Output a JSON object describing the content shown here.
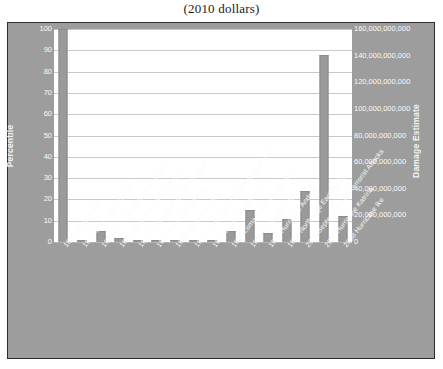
{
  "chart_data": {
    "type": "bar",
    "title": "(2010 dollars)",
    "xlabel": "",
    "ylabel": "Percentile",
    "y2label": "Damage Estimate",
    "ylim": [
      0,
      100
    ],
    "y2lim": [
      0,
      160000000000
    ],
    "grid": true,
    "legend": false,
    "bar_color": "#9a9a9a",
    "plot_background": "#ffffff",
    "chart_background": "#9d9d9d",
    "categories": [
      "1871 Chicago Fire",
      "1900 Galveston Hurricane",
      "1906 San Francisco Earthquake",
      "1927 Great Mississippi Flood",
      "1964 Alaska Earthquake Tsunami",
      "1969 Hurricane Camille",
      "1965 Hurricane Betsy",
      "1974 Xenia (Super) Tornado Outbreak",
      "1980 Mount St. Helens",
      "1989 Loma Prieta Earthquake",
      "1989 Hurricane Hugo",
      "1992 Hurricane Andrew",
      "1994 Northridge Earthquake",
      "2001 September 11th Terrorist Attacks",
      "2005 Hurricane Katrina",
      "2008 Hurricane Ike"
    ],
    "values": [
      100,
      1,
      5,
      2,
      0.6,
      0.6,
      0.6,
      0.6,
      0.6,
      5,
      15,
      4,
      11,
      24,
      88,
      12
    ],
    "damage_estimates": [
      160000000000,
      1600000000,
      8000000000,
      3200000000,
      960000000,
      960000000,
      960000000,
      960000000,
      960000000,
      8000000000,
      24000000000,
      6400000000,
      17600000000,
      38400000000,
      140800000000,
      19200000000
    ],
    "y_ticks": [
      0,
      10,
      20,
      30,
      40,
      50,
      60,
      70,
      80,
      90,
      100
    ],
    "y2_ticks": [
      "0",
      "20,000,000,000",
      "40,000,000,000",
      "60,000,000,000",
      "80,000,000,000",
      "100,000,000,000",
      "120,000,000,000",
      "140,000,000,000",
      "160,000,000,000"
    ]
  }
}
